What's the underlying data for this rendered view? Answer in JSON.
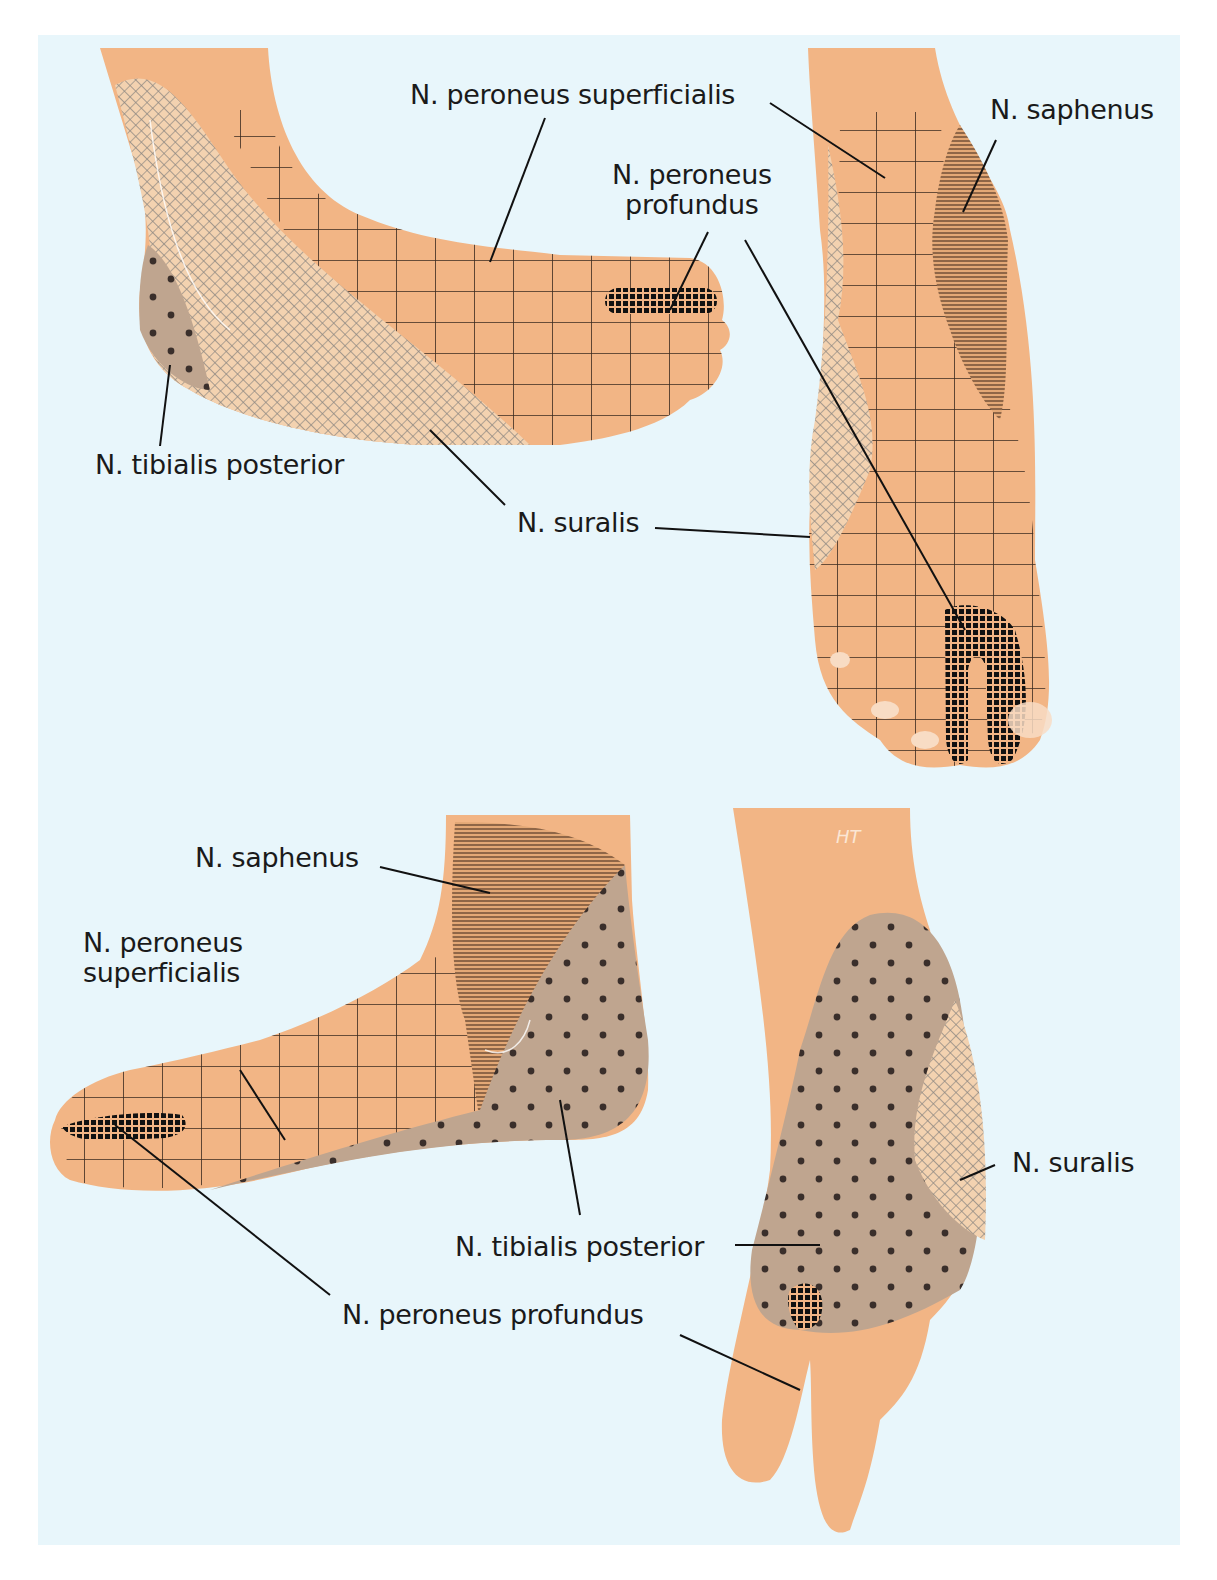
{
  "figure": {
    "colors": {
      "background": "#e8f6fb",
      "skin": "#f2b585",
      "n_peroneus_superficialis_pattern": "grid",
      "n_peroneus_profundus_pattern": "dense-grid",
      "n_saphenus_pattern": "horizontal-lines",
      "n_suralis_pattern": "crosshatch",
      "n_tibialis_posterior_pattern": "dots",
      "tibialis_fill": "#bfa58f",
      "suralis_fill": "#f3d2b0",
      "line": "#111111"
    },
    "signature": "HT"
  },
  "views": [
    {
      "id": "lateral-top-left",
      "labels": [
        {
          "key": "peroneus_superficialis",
          "text": "N. peroneus superficialis"
        },
        {
          "key": "peroneus_profundus",
          "text": "N. peroneus\nprofundus"
        },
        {
          "key": "tibialis_posterior",
          "text": "N. tibialis posterior"
        },
        {
          "key": "suralis",
          "text": "N. suralis"
        }
      ]
    },
    {
      "id": "dorsal-top-right",
      "labels": [
        {
          "key": "saphenus",
          "text": "N. saphenus"
        }
      ]
    },
    {
      "id": "medial-bottom-left",
      "labels": [
        {
          "key": "saphenus",
          "text": "N. saphenus"
        },
        {
          "key": "peroneus_superficialis",
          "text": "N. peroneus\nsuperficialis"
        },
        {
          "key": "tibialis_posterior",
          "text": "N. tibialis posterior"
        },
        {
          "key": "peroneus_profundus",
          "text": "N. peroneus profundus"
        }
      ]
    },
    {
      "id": "plantar-bottom-right",
      "labels": [
        {
          "key": "suralis",
          "text": "N. suralis"
        }
      ]
    }
  ]
}
